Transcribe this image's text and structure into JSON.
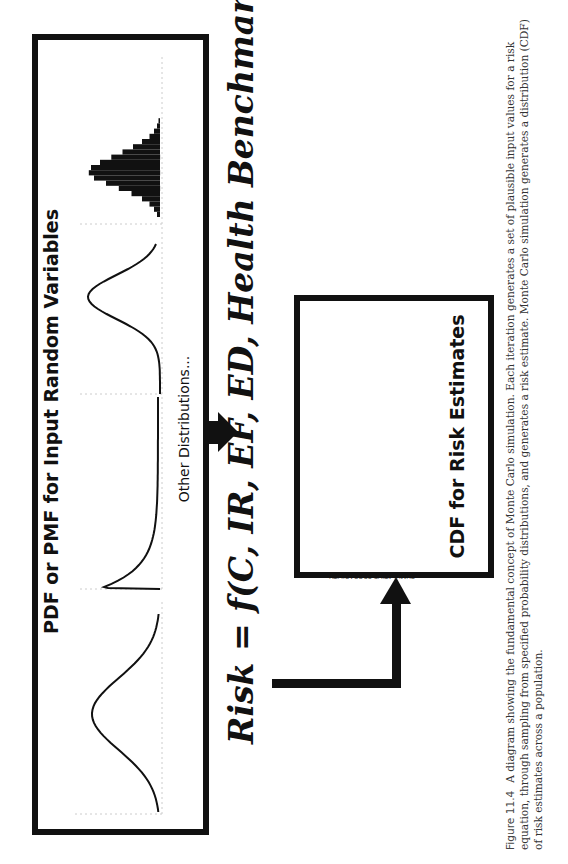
{
  "input_panel": {
    "title": "PDF or PMF for Input Random Variables",
    "subtitle": "Other Distributions...",
    "distributions": [
      {
        "name": "normal",
        "kind": "pdf-curve",
        "description": "Symmetric bell curve"
      },
      {
        "name": "lognormal",
        "kind": "pdf-curve",
        "description": "Right-skewed curve with sharp peak near zero"
      },
      {
        "name": "normal-narrow",
        "kind": "pdf-curve",
        "description": "Symmetric bell curve"
      },
      {
        "name": "histogram",
        "kind": "pmf-bars",
        "description": "Discrete bar distribution"
      }
    ]
  },
  "formula": {
    "text": "Risk = f(C, IR, EF, ED, Health Benchmark, …)"
  },
  "output_panel": {
    "title": "CDF for Risk Estimates"
  },
  "chart_data": {
    "type": "line",
    "title": "CDF for Risk Estimates",
    "xlabel": "RISK",
    "ylabel": "CUMULATIVE PROBABILITY",
    "xscale": "log",
    "xlim": [
      1e-15,
      0.001
    ],
    "ylim": [
      0,
      1
    ],
    "x_ticks": [
      "1.0E-15",
      "1.0E-13",
      "1.0E-11",
      "1.0E-09",
      "1.0E-07",
      "1.0E-05",
      "1.0E-03"
    ],
    "y_ticks": [
      "0",
      "0.1",
      "0.2",
      "0.3",
      "0.4",
      "0.5",
      "0.6",
      "0.7",
      "0.8",
      "0.9",
      "1"
    ],
    "series": [
      {
        "name": "CDF",
        "x_log10": [
          -14.6,
          -13.5,
          -13.0,
          -12.5,
          -12.0,
          -11.5,
          -11.0,
          -10.5,
          -10.0,
          -9.5,
          -9.0,
          -8.5,
          -8.0,
          -7.5,
          -7.0,
          -6.5,
          -6.0,
          -5.5,
          -5.0,
          -4.5,
          -4.0,
          -3.5
        ],
        "y": [
          0.0,
          0.0,
          0.01,
          0.02,
          0.04,
          0.07,
          0.11,
          0.16,
          0.22,
          0.3,
          0.38,
          0.47,
          0.56,
          0.65,
          0.74,
          0.81,
          0.86,
          0.89,
          0.91,
          0.93,
          0.94,
          0.95
        ]
      }
    ],
    "grid": false
  },
  "caption": {
    "figure_label": "Figure 11.4",
    "text": "A diagram showing the fundamental concept of Monte Carlo simulation. Each iteration generates a set of plausible input values for a risk equation, through sampling from specified probability distributions, and generates a risk estimate. Monte Carlo simulation generates a distribution (CDF) of risk estimates across a population."
  }
}
